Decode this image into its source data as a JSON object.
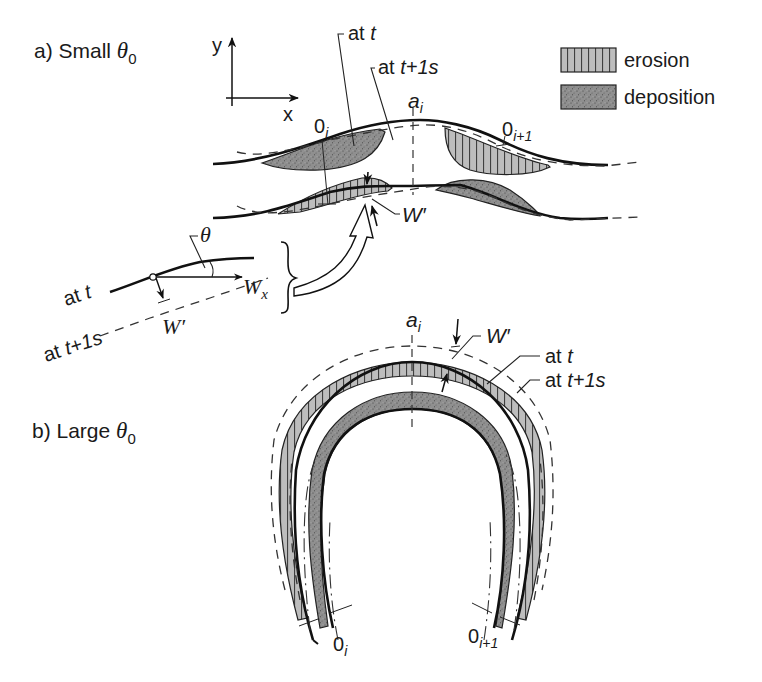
{
  "figure": {
    "panel_a": {
      "label_prefix": "a) Small ",
      "theta": "θ",
      "theta_sub": "0"
    },
    "panel_b": {
      "label_prefix": "b) Large ",
      "theta": "θ",
      "theta_sub": "0"
    },
    "axes": {
      "x": "x",
      "y": "y"
    },
    "legend": {
      "erosion": "erosion",
      "deposition": "deposition",
      "colors": {
        "erosion_fill": "#b8b8b8",
        "deposition_fill": "#8e8e8e",
        "stroke": "#222222"
      }
    },
    "annotations_a": {
      "at_t": "at ",
      "at_t_var": "t",
      "at_t1s": "at ",
      "at_t1s_var": "t+1s",
      "a_i": "a",
      "a_i_sub": "i",
      "o_i": "0",
      "o_i_sub": "i",
      "o_i1": "0",
      "o_i1_sub": "i+1",
      "w_prime": "W′"
    },
    "inset": {
      "theta": "θ",
      "at_t": "at ",
      "at_t_var": "t",
      "at_t1s": "at ",
      "at_t1s_var": "t+1s",
      "w_prime": "W′",
      "w_x": "W",
      "w_x_sub": "x"
    },
    "annotations_b": {
      "a_i": "a",
      "a_i_sub": "i",
      "w_prime": "W′",
      "at_t": "at ",
      "at_t_var": "t",
      "at_t1s": "at ",
      "at_t1s_var": "t+1s",
      "o_i": "0",
      "o_i_sub": "i",
      "o_i1": "0",
      "o_i1_sub": "i+1"
    }
  }
}
